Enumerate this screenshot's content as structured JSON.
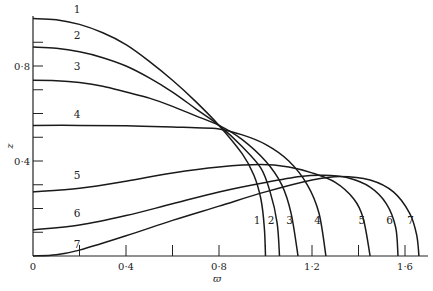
{
  "chart_data": {
    "type": "line",
    "title": "",
    "xlabel": "ϖ",
    "ylabel": "z",
    "xlim": [
      0,
      1.7
    ],
    "ylim": [
      0,
      1.02
    ],
    "grid": false,
    "legend": "none (curves labelled inline 1–7)",
    "x_ticks": [
      0,
      0.2,
      0.4,
      0.6,
      0.8,
      1.0,
      1.2,
      1.4,
      1.6
    ],
    "x_tick_labels": [
      {
        "value": 0,
        "label": "0"
      },
      {
        "value": 0.4,
        "label": "0·4"
      },
      {
        "value": 0.8,
        "label": "0·8"
      },
      {
        "value": 1.2,
        "label": "1·2"
      },
      {
        "value": 1.6,
        "label": "1·6"
      }
    ],
    "y_ticks": [
      0.1,
      0.2,
      0.3,
      0.4,
      0.5,
      0.6,
      0.7,
      0.8,
      0.9
    ],
    "y_tick_labels": [
      {
        "value": 0.4,
        "label": "0·4"
      },
      {
        "value": 0.8,
        "label": "0·8"
      }
    ],
    "series": [
      {
        "name": "1",
        "start_label": "1",
        "end_label": "1",
        "points": [
          [
            0,
            1.0
          ],
          [
            0.1,
            0.995
          ],
          [
            0.2,
            0.975
          ],
          [
            0.3,
            0.94
          ],
          [
            0.4,
            0.89
          ],
          [
            0.5,
            0.82
          ],
          [
            0.6,
            0.74
          ],
          [
            0.7,
            0.65
          ],
          [
            0.8,
            0.55
          ],
          [
            0.9,
            0.43
          ],
          [
            0.95,
            0.34
          ],
          [
            0.98,
            0.24
          ],
          [
            0.995,
            0.12
          ],
          [
            1.0,
            0.0
          ]
        ]
      },
      {
        "name": "2",
        "start_label": "2",
        "end_label": "2",
        "points": [
          [
            0,
            0.88
          ],
          [
            0.1,
            0.875
          ],
          [
            0.2,
            0.86
          ],
          [
            0.3,
            0.835
          ],
          [
            0.4,
            0.8
          ],
          [
            0.5,
            0.75
          ],
          [
            0.6,
            0.69
          ],
          [
            0.7,
            0.62
          ],
          [
            0.8,
            0.55
          ],
          [
            0.9,
            0.46
          ],
          [
            0.98,
            0.37
          ],
          [
            1.02,
            0.27
          ],
          [
            1.05,
            0.14
          ],
          [
            1.06,
            0.0
          ]
        ]
      },
      {
        "name": "3",
        "start_label": "3",
        "end_label": "3",
        "points": [
          [
            0,
            0.74
          ],
          [
            0.1,
            0.738
          ],
          [
            0.2,
            0.73
          ],
          [
            0.3,
            0.715
          ],
          [
            0.4,
            0.69
          ],
          [
            0.5,
            0.665
          ],
          [
            0.6,
            0.63
          ],
          [
            0.7,
            0.59
          ],
          [
            0.8,
            0.55
          ],
          [
            0.9,
            0.49
          ],
          [
            1.0,
            0.4
          ],
          [
            1.07,
            0.3
          ],
          [
            1.11,
            0.18
          ],
          [
            1.14,
            0.0
          ]
        ]
      },
      {
        "name": "4",
        "start_label": "4",
        "end_label": "4",
        "points": [
          [
            0,
            0.55
          ],
          [
            0.2,
            0.55
          ],
          [
            0.4,
            0.548
          ],
          [
            0.6,
            0.543
          ],
          [
            0.7,
            0.54
          ],
          [
            0.8,
            0.535
          ],
          [
            0.9,
            0.51
          ],
          [
            1.0,
            0.47
          ],
          [
            1.1,
            0.4
          ],
          [
            1.18,
            0.3
          ],
          [
            1.23,
            0.18
          ],
          [
            1.26,
            0.0
          ]
        ]
      },
      {
        "name": "5",
        "start_label": "5",
        "end_label": "5",
        "points": [
          [
            0,
            0.27
          ],
          [
            0.2,
            0.285
          ],
          [
            0.4,
            0.315
          ],
          [
            0.6,
            0.35
          ],
          [
            0.8,
            0.375
          ],
          [
            0.98,
            0.385
          ],
          [
            1.1,
            0.375
          ],
          [
            1.2,
            0.35
          ],
          [
            1.3,
            0.31
          ],
          [
            1.38,
            0.24
          ],
          [
            1.42,
            0.16
          ],
          [
            1.45,
            0.0
          ]
        ]
      },
      {
        "name": "6",
        "start_label": "6",
        "end_label": "6",
        "points": [
          [
            0,
            0.11
          ],
          [
            0.2,
            0.13
          ],
          [
            0.4,
            0.17
          ],
          [
            0.6,
            0.22
          ],
          [
            0.8,
            0.27
          ],
          [
            1.0,
            0.31
          ],
          [
            1.15,
            0.335
          ],
          [
            1.25,
            0.34
          ],
          [
            1.35,
            0.33
          ],
          [
            1.45,
            0.29
          ],
          [
            1.52,
            0.22
          ],
          [
            1.56,
            0.12
          ],
          [
            1.57,
            0.0
          ]
        ]
      },
      {
        "name": "7",
        "start_label": "7",
        "end_label": "7",
        "points": [
          [
            0,
            0.0
          ],
          [
            0.1,
            0.005
          ],
          [
            0.2,
            0.025
          ],
          [
            0.4,
            0.085
          ],
          [
            0.6,
            0.15
          ],
          [
            0.8,
            0.21
          ],
          [
            1.0,
            0.27
          ],
          [
            1.2,
            0.32
          ],
          [
            1.32,
            0.335
          ],
          [
            1.45,
            0.32
          ],
          [
            1.55,
            0.27
          ],
          [
            1.62,
            0.18
          ],
          [
            1.65,
            0.09
          ],
          [
            1.66,
            0.0
          ]
        ]
      }
    ]
  }
}
